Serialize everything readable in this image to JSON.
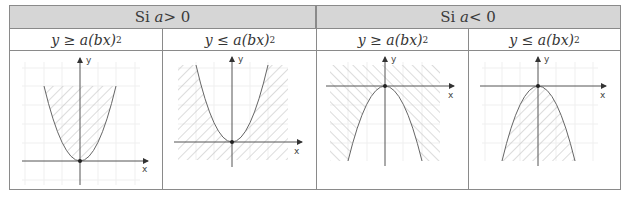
{
  "table": {
    "headers": [
      {
        "prefix": "Si ",
        "var": "a",
        "rel": " > 0"
      },
      {
        "prefix": "Si ",
        "var": "a",
        "rel": " < 0"
      }
    ],
    "columns": [
      {
        "lhs": "y",
        "op": " ≥ ",
        "rhs_a": "a",
        "rhs_paren": "(bx)",
        "exp": "2",
        "case": "a > 0",
        "shading": "inside (above curve)"
      },
      {
        "lhs": "y",
        "op": " ≤ ",
        "rhs_a": "a",
        "rhs_paren": "(bx)",
        "exp": "2",
        "case": "a > 0",
        "shading": "outside (below curve)"
      },
      {
        "lhs": "y",
        "op": " ≥ ",
        "rhs_a": "a",
        "rhs_paren": "(bx)",
        "exp": "2",
        "case": "a < 0",
        "shading": "outside (above curve)"
      },
      {
        "lhs": "y",
        "op": " ≤ ",
        "rhs_a": "a",
        "rhs_paren": "(bx)",
        "exp": "2",
        "case": "a < 0",
        "shading": "inside (below curve)"
      }
    ]
  },
  "graphs": {
    "x_label": "x",
    "y_label": "y"
  },
  "colors": {
    "header_bg": "#d6d6d6",
    "border": "#8a8a8a",
    "curve": "#555555",
    "hatch": "#c8c8c8",
    "grid": "#eeeeee",
    "axis": "#444444"
  }
}
